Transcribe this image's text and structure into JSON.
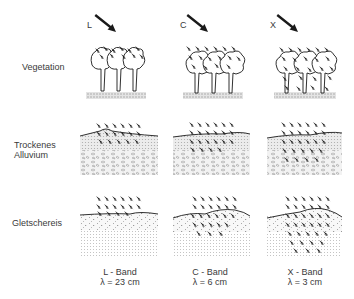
{
  "rows": [
    {
      "id": "vegetation",
      "label": "Vegetation",
      "label_lines": [
        "Vegetation"
      ]
    },
    {
      "id": "alluvium",
      "label": "Trockenes Alluvium",
      "label_lines": [
        "Trockenes",
        "Alluvium"
      ]
    },
    {
      "id": "ice",
      "label": "Gletschereis",
      "label_lines": [
        "Gletschereis"
      ]
    }
  ],
  "columns": [
    {
      "id": "L",
      "letter": "L",
      "band": "L - Band",
      "wavelength": "λ = 23 cm",
      "cx": 120
    },
    {
      "id": "C",
      "letter": "C",
      "band": "C - Band",
      "wavelength": "λ = 6 cm",
      "cx": 210
    },
    {
      "id": "X",
      "letter": "X",
      "band": "X - Band",
      "wavelength": "λ = 3 cm",
      "cx": 305
    }
  ],
  "penetration": {
    "vegetation": {
      "L": "canopy-top",
      "C": "canopy",
      "X": "full-canopy-to-ground"
    },
    "alluvium": {
      "L": "shallow",
      "C": "medium",
      "X": "deep"
    },
    "ice": {
      "L": "surface",
      "C": "medium",
      "X": "deep"
    }
  },
  "colors": {
    "ink": "#1a1a1a",
    "ground": "#bdbdbd",
    "alluvium_top": "#d6d6d6",
    "alluvium_gravel": "#c8c8c8",
    "ice_dots": "#cfcfcf"
  }
}
